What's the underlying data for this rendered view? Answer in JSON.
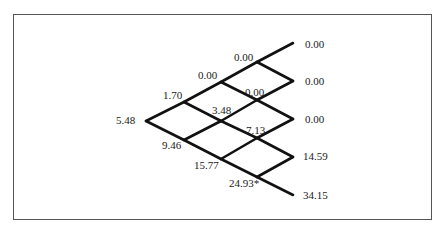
{
  "diagram": {
    "type": "binomial-tree",
    "steps": 4,
    "line_color": "#111111",
    "frame_color": "#555555",
    "nodes": {
      "root": "5.48",
      "s1_up": "1.70",
      "s1_down": "9.46",
      "s2_uu": "0.00",
      "s2_ud": "3.48",
      "s2_dd": "15.77",
      "s3_uuu": "0.00",
      "s3_uud": "0.00",
      "s3_udd": "7.13",
      "s3_ddd": "24.93*",
      "s4_0": "0.00",
      "s4_1": "0.00",
      "s4_2": "0.00",
      "s4_3": "14.59",
      "s4_4": "34.15"
    }
  }
}
